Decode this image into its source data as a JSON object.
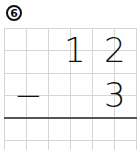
{
  "problem": {
    "number": "6",
    "badge": "⑥",
    "operator": "−",
    "top_digits": [
      "1",
      "2"
    ],
    "bottom_digits": [
      "3"
    ]
  },
  "colors": {
    "grid": "#d6d6d6",
    "rule": "#555555",
    "ink": "#111111"
  }
}
